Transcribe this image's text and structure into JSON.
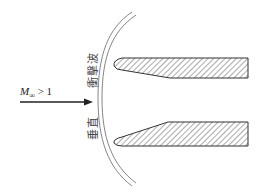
{
  "diagram": {
    "freestream_label": {
      "symbol": "M",
      "subscript": "∞",
      "relation": " > 1"
    },
    "shock_label": {
      "part1": "垂直",
      "part2": "衝擊波"
    },
    "colors": {
      "line": "#333333",
      "hatch": "#555555",
      "shock": "#777777"
    }
  }
}
